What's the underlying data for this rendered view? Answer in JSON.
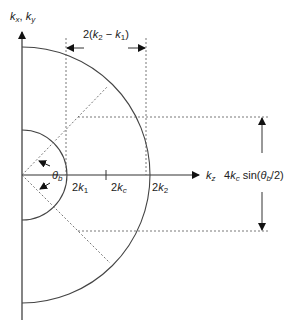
{
  "diagram": {
    "axes": {
      "vertical_label": {
        "k1": "k",
        "s1": "x",
        "sep": ", ",
        "k2": "k",
        "s2": "y"
      },
      "horizontal_label": {
        "k": "k",
        "s": "z"
      }
    },
    "ticks": {
      "k1": {
        "pre": "2",
        "k": "k",
        "s": "1"
      },
      "kc": {
        "pre": "2",
        "k": "k",
        "s": "c"
      },
      "k2": {
        "pre": "2",
        "k": "k",
        "s": "2"
      }
    },
    "angle_label": {
      "theta": "θ",
      "s": "b"
    },
    "width_label": {
      "a": "2(",
      "k1": "k",
      "s1": "2",
      "minus": " − ",
      "k2": "k",
      "s2": "1",
      "b": ")"
    },
    "height_label": {
      "a": "4",
      "k": "k",
      "s": "c",
      "sin": " sin(",
      "theta": "θ",
      "ts": "b",
      "b": "/2)"
    },
    "colors": {
      "stroke": "#333333",
      "dashed": "#555555",
      "background": "#ffffff"
    }
  }
}
